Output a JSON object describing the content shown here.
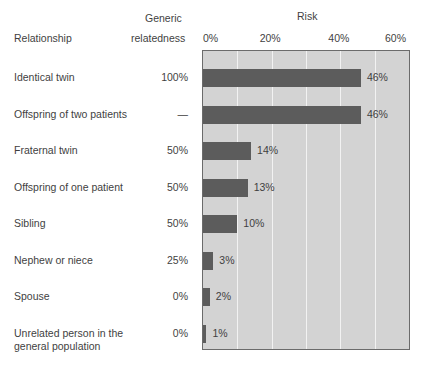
{
  "headers": {
    "relationship": "Relationship",
    "generic_line1": "Generic",
    "generic_line2": "relatedness",
    "risk": "Risk"
  },
  "chart_data": {
    "type": "bar",
    "title": "Risk",
    "xlabel": "Risk",
    "ylabel": "Relationship",
    "orientation": "horizontal",
    "xlim": [
      0,
      60
    ],
    "xticks": [
      0,
      20,
      40,
      60
    ],
    "xtick_labels": [
      "0%",
      "20%",
      "40%",
      "60%"
    ],
    "minor_gridline_step": 10,
    "grid": true,
    "legend": false,
    "bar_color": "#5c5c5c",
    "plot_background": "#d3d3d3",
    "categories": [
      "Identical twin",
      "Offspring of two patients",
      "Fraternal twin",
      "Offspring of one patient",
      "Sibling",
      "Nephew or niece",
      "Spouse",
      "Unrelated person in the general population"
    ],
    "values": [
      46,
      46,
      14,
      13,
      10,
      3,
      2,
      1
    ],
    "value_labels": [
      "46%",
      "46%",
      "14%",
      "13%",
      "10%",
      "3%",
      "2%",
      "1%"
    ],
    "genetic_relatedness": [
      "100%",
      "—",
      "50%",
      "50%",
      "50%",
      "25%",
      "0%",
      "0%"
    ]
  },
  "rows": [
    {
      "label_line1": "Identical twin",
      "label_line2": "",
      "relatedness": "100%",
      "value_label": "46%"
    },
    {
      "label_line1": "Offspring of two patients",
      "label_line2": "",
      "relatedness": "—",
      "value_label": "46%"
    },
    {
      "label_line1": "Fraternal twin",
      "label_line2": "",
      "relatedness": "50%",
      "value_label": "14%"
    },
    {
      "label_line1": "Offspring of one patient",
      "label_line2": "",
      "relatedness": "50%",
      "value_label": "13%"
    },
    {
      "label_line1": "Sibling",
      "label_line2": "",
      "relatedness": "50%",
      "value_label": "10%"
    },
    {
      "label_line1": "Nephew or niece",
      "label_line2": "",
      "relatedness": "25%",
      "value_label": "3%"
    },
    {
      "label_line1": "Spouse",
      "label_line2": "",
      "relatedness": "0%",
      "value_label": "2%"
    },
    {
      "label_line1": "Unrelated person in the",
      "label_line2": "general population",
      "relatedness": "0%",
      "value_label": "1%"
    }
  ]
}
